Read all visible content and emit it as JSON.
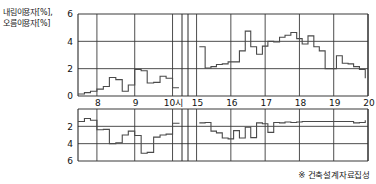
{
  "figure": {
    "y_axis_label_line1": "내림이용자[%],",
    "y_axis_label_line2": "오름이용자[%]",
    "source_note": "※ 건축설계자료집성"
  },
  "chart_data": {
    "type": "line",
    "title": "",
    "subtitle": "",
    "xlabel": "",
    "ylabel": "내림이용자[%], 오름이용자[%]",
    "grid": true,
    "legend": "none",
    "x_tick_labels": [
      "8",
      "9",
      "10시",
      "15",
      "16",
      "17",
      "18",
      "19",
      "20"
    ],
    "x_tick_values": [
      8,
      9,
      10,
      15,
      16,
      17,
      18,
      19,
      20
    ],
    "x_break": true,
    "x_segments": [
      {
        "from": 7.5,
        "to": 10.25
      },
      {
        "from": 14.75,
        "to": 20.0
      }
    ],
    "y_upper_ticks": [
      0,
      2,
      4,
      6
    ],
    "y_lower_ticks": [
      0,
      2,
      4,
      6
    ],
    "ylim_upper": [
      0,
      6
    ],
    "ylim_lower": [
      0,
      6
    ],
    "series": [
      {
        "name": "오름이용자[%]",
        "direction": "up",
        "panel": "upper",
        "units": "%",
        "step": true,
        "x": [
          7.5,
          7.58,
          7.67,
          7.75,
          7.83,
          7.92,
          8.0,
          8.08,
          8.17,
          8.25,
          8.33,
          8.42,
          8.5,
          8.58,
          8.67,
          8.75,
          8.83,
          8.92,
          9.0,
          9.08,
          9.17,
          9.25,
          9.33,
          9.42,
          9.5,
          9.58,
          9.67,
          9.75,
          9.83,
          9.92,
          10.0,
          10.08,
          10.17,
          14.75,
          14.83,
          14.92,
          15.0,
          15.08,
          15.17,
          15.25,
          15.33,
          15.42,
          15.5,
          15.58,
          15.67,
          15.75,
          15.83,
          15.92,
          16.0,
          16.08,
          16.17,
          16.25,
          16.33,
          16.42,
          16.5,
          16.58,
          16.67,
          16.75,
          16.83,
          16.92,
          17.0,
          17.08,
          17.17,
          17.25,
          17.33,
          17.42,
          17.5,
          17.58,
          17.67,
          17.75,
          17.83,
          17.92,
          18.0,
          18.08,
          18.17,
          18.25,
          18.33,
          18.42,
          18.5,
          18.58,
          18.67,
          18.75,
          18.83,
          18.92,
          19.0,
          19.08,
          19.17,
          19.25,
          19.33,
          19.42,
          19.5,
          19.58,
          19.67,
          19.75,
          19.83,
          19.92
        ],
        "values": [
          0.15,
          0.15,
          0.25,
          0.25,
          0.35,
          0.35,
          0.5,
          0.5,
          0.7,
          0.7,
          1.35,
          1.35,
          1.2,
          1.2,
          0.35,
          0.35,
          0.8,
          0.8,
          1.95,
          1.95,
          1.85,
          1.85,
          0.95,
          0.95,
          1.0,
          1.0,
          1.45,
          1.45,
          1.3,
          1.3,
          0.6,
          0.6,
          0.6,
          0.0,
          0.0,
          0.0,
          0.0,
          3.6,
          3.6,
          2.05,
          2.05,
          2.15,
          2.15,
          2.3,
          2.3,
          2.35,
          2.35,
          2.5,
          2.5,
          2.5,
          2.5,
          3.3,
          3.3,
          4.75,
          4.75,
          3.6,
          3.6,
          3.05,
          3.05,
          3.65,
          3.65,
          4.0,
          4.0,
          3.95,
          3.95,
          4.3,
          4.3,
          4.45,
          4.45,
          4.65,
          4.65,
          4.2,
          4.2,
          3.8,
          3.8,
          4.4,
          4.4,
          3.6,
          3.6,
          3.3,
          3.3,
          2.0,
          2.0,
          2.0,
          2.0,
          2.95,
          2.95,
          2.4,
          2.4,
          2.35,
          2.35,
          2.15,
          2.15,
          1.95,
          1.95,
          1.3
        ]
      },
      {
        "name": "내림이용자[%]",
        "direction": "down",
        "panel": "lower",
        "units": "%",
        "step": true,
        "x": [
          7.5,
          7.58,
          7.67,
          7.75,
          7.83,
          7.92,
          8.0,
          8.08,
          8.17,
          8.25,
          8.33,
          8.42,
          8.5,
          8.58,
          8.67,
          8.75,
          8.83,
          8.92,
          9.0,
          9.08,
          9.17,
          9.25,
          9.33,
          9.42,
          9.5,
          9.58,
          9.67,
          9.75,
          9.83,
          9.92,
          10.0,
          10.08,
          10.17,
          14.75,
          14.83,
          14.92,
          15.0,
          15.08,
          15.17,
          15.25,
          15.33,
          15.42,
          15.5,
          15.58,
          15.67,
          15.75,
          15.83,
          15.92,
          16.0,
          16.08,
          16.17,
          16.25,
          16.33,
          16.42,
          16.5,
          16.58,
          16.67,
          16.75,
          16.83,
          16.92,
          17.0,
          17.08,
          17.17,
          17.25,
          17.33,
          17.42,
          17.5,
          17.58,
          17.67,
          17.75,
          17.83,
          17.92,
          18.0,
          18.08,
          18.17,
          18.25,
          18.33,
          18.42,
          18.5,
          18.58,
          18.67,
          18.75,
          18.83,
          18.92,
          19.0,
          19.08,
          19.17,
          19.25,
          19.33,
          19.42,
          19.5,
          19.58,
          19.67,
          19.75,
          19.83,
          19.92
        ],
        "values": [
          1.45,
          1.45,
          1.1,
          1.1,
          1.3,
          1.3,
          2.4,
          2.4,
          2.35,
          2.35,
          4.0,
          4.0,
          3.9,
          3.9,
          3.0,
          3.0,
          2.55,
          2.55,
          3.05,
          3.05,
          5.1,
          5.1,
          5.0,
          5.0,
          3.25,
          3.25,
          3.0,
          3.0,
          2.9,
          2.9,
          1.65,
          1.65,
          1.7,
          0.0,
          0.0,
          0.0,
          0.0,
          1.6,
          1.6,
          1.55,
          1.55,
          2.55,
          2.55,
          2.75,
          2.75,
          3.35,
          3.35,
          3.45,
          3.45,
          2.5,
          2.5,
          3.35,
          3.35,
          2.1,
          2.1,
          3.3,
          3.3,
          1.6,
          1.6,
          1.7,
          1.7,
          2.7,
          2.7,
          1.55,
          1.55,
          1.6,
          1.6,
          1.5,
          1.5,
          1.55,
          1.55,
          1.5,
          1.5,
          1.45,
          1.45,
          1.45,
          1.45,
          1.45,
          1.45,
          1.45,
          1.45,
          1.45,
          1.45,
          1.45,
          1.45,
          1.45,
          1.45,
          1.45,
          1.45,
          1.45,
          1.45,
          1.6,
          1.6,
          1.55,
          1.55,
          1.3
        ]
      }
    ],
    "colors": {
      "line": "#4a4a4a",
      "grid": "#3a3a3a",
      "axis": "#2a2a2a",
      "background": "#ffffff"
    }
  }
}
